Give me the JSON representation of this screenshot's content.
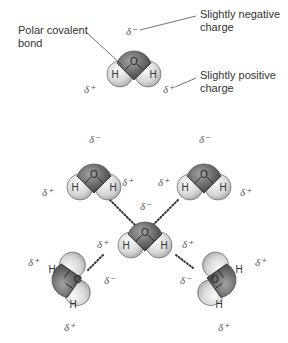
{
  "labels": {
    "polar_bond": [
      "Polar covalent",
      "bond"
    ],
    "neg_charge": [
      "Slightly negative",
      "charge"
    ],
    "pos_charge": [
      "Slightly positive",
      "charge"
    ]
  },
  "symbols": {
    "delta_minus": "δ⁻",
    "delta_plus": "δ⁺",
    "oxygen": "O",
    "hydrogen": "H"
  },
  "colors": {
    "oxygen_dark": "#4a4a4a",
    "oxygen_light": "#9a9a9a",
    "hydrogen_light": "#f2f2f2",
    "hydrogen_dark": "#b8b8b8",
    "outline": "#333333",
    "hbond": "#333333"
  }
}
